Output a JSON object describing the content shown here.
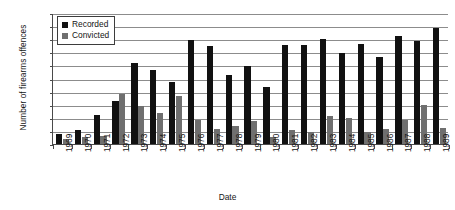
{
  "chart_data": {
    "type": "bar",
    "title": "",
    "xlabel": "Date",
    "ylabel": "Number of firearms offences",
    "ylim": [
      0,
      100
    ],
    "ytick_step": 10,
    "yticks": [
      0,
      10,
      20,
      30,
      40,
      50,
      60,
      70,
      80,
      90,
      100
    ],
    "grid": true,
    "legend_position": "top-left",
    "categories": [
      "1969",
      "1970",
      "1971",
      "1972",
      "1973",
      "1974",
      "1975",
      "1976",
      "1977",
      "1978",
      "1979",
      "1980",
      "1981",
      "1982",
      "1983",
      "1984",
      "1985",
      "1986",
      "1987",
      "1988",
      "1989"
    ],
    "series": [
      {
        "name": "Recorded",
        "color": "#111111",
        "values": [
          8,
          10.5,
          22,
          32.5,
          61.5,
          56.5,
          47.5,
          79.5,
          74.5,
          52.5,
          59.5,
          43.5,
          75.5,
          75.5,
          80.5,
          69.5,
          76.5,
          66.5,
          82.5,
          78.5,
          88.5
        ]
      },
      {
        "name": "Convicted",
        "color": "#6f6f6f",
        "values": [
          4,
          5,
          6.5,
          38.5,
          29,
          23.5,
          36.5,
          18,
          11.5,
          13.5,
          17.5,
          5.5,
          10.5,
          9.5,
          21.5,
          19.5,
          9.5,
          11.5,
          18.5,
          29.5,
          12.5
        ]
      }
    ]
  },
  "legend": {
    "entries": [
      {
        "label": "Recorded",
        "swatch": "recorded"
      },
      {
        "label": "Convicted",
        "swatch": "convicted"
      }
    ]
  },
  "colors": {
    "recorded": "#111111",
    "convicted": "#6f6f6f",
    "gridline": "#8c8c8c",
    "axis": "#4a4a4a",
    "background": "#ffffff"
  }
}
